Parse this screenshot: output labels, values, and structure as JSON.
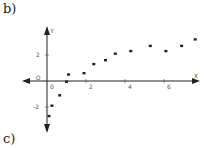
{
  "labels": {
    "top": "b)",
    "bottom": "c)"
  },
  "chart_data": {
    "type": "scatter",
    "title": "",
    "xlabel": "X",
    "ylabel": "Y",
    "origin_label": "O",
    "xlim": [
      -1,
      7.8
    ],
    "ylim": [
      -3.2,
      3.8
    ],
    "x_ticks": [
      "0",
      "2",
      "4",
      "6"
    ],
    "y_ticks": [
      "2",
      "-2"
    ],
    "grid": false,
    "points": [
      {
        "x": 0.1,
        "y": -2.7
      },
      {
        "x": 0.25,
        "y": -1.9
      },
      {
        "x": 0.65,
        "y": -1.1
      },
      {
        "x": 1.0,
        "y": -0.05
      },
      {
        "x": 1.1,
        "y": 0.5
      },
      {
        "x": 1.9,
        "y": 0.6
      },
      {
        "x": 2.4,
        "y": 1.3
      },
      {
        "x": 3.0,
        "y": 1.6
      },
      {
        "x": 3.5,
        "y": 2.1
      },
      {
        "x": 4.3,
        "y": 2.3
      },
      {
        "x": 5.3,
        "y": 2.7
      },
      {
        "x": 6.1,
        "y": 2.3
      },
      {
        "x": 6.9,
        "y": 2.7
      },
      {
        "x": 7.6,
        "y": 3.2
      }
    ]
  }
}
